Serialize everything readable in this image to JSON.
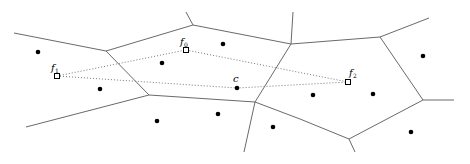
{
  "diagram": {
    "type": "voronoi",
    "colors": {
      "edge": "#6a6a6a",
      "site": "#000000",
      "path": "#777777"
    },
    "edges": [
      [
        14,
        33,
        106,
        51
      ],
      [
        106,
        51,
        193,
        25
      ],
      [
        193,
        25,
        186,
        12
      ],
      [
        193,
        25,
        291,
        44
      ],
      [
        291,
        44,
        293,
        12
      ],
      [
        291,
        44,
        380,
        37
      ],
      [
        380,
        37,
        429,
        18
      ],
      [
        380,
        37,
        423,
        100
      ],
      [
        423,
        100,
        454,
        100
      ],
      [
        423,
        100,
        349,
        139
      ],
      [
        349,
        139,
        355,
        152
      ],
      [
        349,
        139,
        300,
        119
      ],
      [
        300,
        119,
        255,
        102
      ],
      [
        255,
        102,
        291,
        44
      ],
      [
        255,
        102,
        244,
        152
      ],
      [
        255,
        102,
        149,
        95
      ],
      [
        149,
        95,
        106,
        51
      ],
      [
        149,
        95,
        26,
        127
      ]
    ],
    "sites": [
      [
        38,
        52
      ],
      [
        100,
        89
      ],
      [
        162,
        63
      ],
      [
        223,
        44
      ],
      [
        237,
        88
      ],
      [
        157,
        121
      ],
      [
        218,
        114
      ],
      [
        273,
        127
      ],
      [
        313,
        95
      ],
      [
        373,
        94
      ],
      [
        423,
        56
      ],
      [
        411,
        132
      ]
    ],
    "points": [
      {
        "id": "f0",
        "label": "f",
        "sub": "0",
        "x": 186,
        "y": 50,
        "lx": 180,
        "ly": 45
      },
      {
        "id": "f1",
        "label": "f",
        "sub": "1",
        "x": 57,
        "y": 76,
        "lx": 51,
        "ly": 71
      },
      {
        "id": "f2",
        "label": "f",
        "sub": "2",
        "x": 348,
        "y": 82,
        "lx": 349,
        "ly": 76
      }
    ],
    "center": {
      "label": "c",
      "x": 237,
      "y": 88,
      "lx": 233,
      "ly": 82
    },
    "dotted_paths": [
      [
        [
          57,
          76
        ],
        [
          186,
          50
        ],
        [
          348,
          82
        ]
      ],
      [
        [
          57,
          76
        ],
        [
          237,
          88
        ],
        [
          348,
          82
        ]
      ]
    ]
  }
}
